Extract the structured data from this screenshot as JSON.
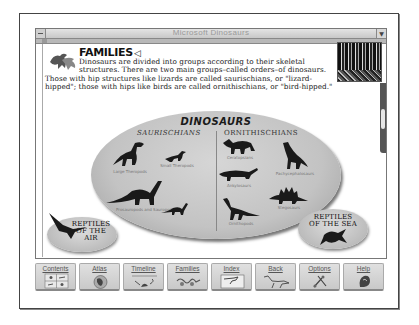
{
  "window": {
    "title": "Microsoft Dinosaurs",
    "system_menu_icon": "system-menu-icon",
    "minimize_icon": "down-arrow-icon"
  },
  "page": {
    "heading": "FAMILIES",
    "speaker_icon": "speaker-icon",
    "speaker_glyph": "◁",
    "intro_lines": [
      "Dinosaurs are divided into groups according to their skeletal",
      "structures. There are two main groups–called orders–of dinosaurs.",
      "Those with hip structures like lizards are called saurischians, or \"lizard-",
      "hipped\"; those with hips like birds are called ornithischians, or \"bird-hipped.\""
    ]
  },
  "diagram": {
    "title": "DINOSAURS",
    "left_order": "SAURISCHIANS",
    "right_order": "ORNITHISCHIANS",
    "groups": [
      {
        "id": "large-theropods",
        "label": "Large Theropods",
        "order": "saurischians"
      },
      {
        "id": "small-theropods",
        "label": "Small Theropods",
        "order": "saurischians"
      },
      {
        "id": "prosauropods-sauropods",
        "label": "Prosauropods and Sauropods",
        "order": "saurischians"
      },
      {
        "id": "ceratopsians",
        "label": "Ceratopsians",
        "order": "ornithischians"
      },
      {
        "id": "pachycephalosaurs",
        "label": "Pachycephalosaurs",
        "order": "ornithischians"
      },
      {
        "id": "ankylosaurs",
        "label": "Ankylosaurs",
        "order": "ornithischians"
      },
      {
        "id": "stegosaurs",
        "label": "Stegosaurs",
        "order": "ornithischians"
      },
      {
        "id": "ornithopods",
        "label": "Ornithopods",
        "order": "ornithischians"
      }
    ],
    "reptiles_air": {
      "line1": "REPTILES",
      "line2": "OF THE AIR"
    },
    "reptiles_sea": {
      "line1": "REPTILES",
      "line2": "OF THE SEA"
    }
  },
  "toolbar": {
    "buttons": [
      {
        "label": "Contents",
        "icon": "contents-grid-icon"
      },
      {
        "label": "Atlas",
        "icon": "globe-icon"
      },
      {
        "label": "Timeline",
        "icon": "timeline-icon"
      },
      {
        "label": "Families",
        "icon": "families-icon"
      },
      {
        "label": "Index",
        "icon": "index-card-icon"
      },
      {
        "label": "Back",
        "icon": "back-dinosaur-icon"
      },
      {
        "label": "Options",
        "icon": "options-tools-icon"
      },
      {
        "label": "Help",
        "icon": "help-icon"
      }
    ]
  },
  "colors": {
    "ellipse": "#c3c3c3",
    "silhouette": "#1a1a1a",
    "button_face": "#d4d4d4",
    "title_text": "#9a9a9a"
  }
}
